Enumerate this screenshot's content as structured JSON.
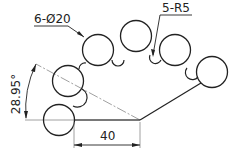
{
  "drawing": {
    "type": "technical-drawing",
    "annotations": {
      "holes_label": "6-Ø20",
      "radius_label": "5-R5",
      "angle_label": "28.95°",
      "length_label": "40"
    },
    "geometry": {
      "big_circle_count": 6,
      "big_circle_diameter": 20,
      "fillet_count": 5,
      "fillet_radius": 5,
      "angle_deg": 28.95,
      "horizontal_length": 40
    },
    "colors": {
      "line": "#222222",
      "centerline": "#888888",
      "background": "#ffffff"
    }
  }
}
